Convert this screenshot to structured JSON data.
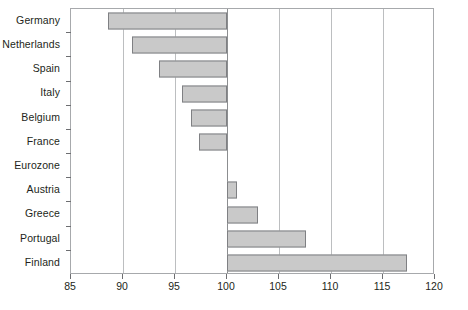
{
  "chart_data": {
    "type": "bar",
    "orientation": "horizontal",
    "title": "",
    "subtitle": "",
    "xlabel": "",
    "ylabel": "",
    "categories": [
      "Germany",
      "Netherlands",
      "Spain",
      "Italy",
      "Belgium",
      "France",
      "Eurozone",
      "Austria",
      "Greece",
      "Portugal",
      "Finland"
    ],
    "values": [
      88.6,
      90.9,
      93.5,
      95.7,
      96.5,
      97.3,
      100,
      101,
      103,
      107.6,
      117.3
    ],
    "baseline": 100,
    "xlim": [
      85,
      120
    ],
    "xticks": [
      85,
      90,
      95,
      100,
      105,
      110,
      115,
      120
    ],
    "xtick_labels": [
      "85",
      "90",
      "95",
      "100",
      "105",
      "110",
      "115",
      "120"
    ],
    "grid": true,
    "grid_axis": "x",
    "legend": null,
    "bar_fill": "#c9c9c9",
    "bar_border": "#7f8083",
    "grid_color": "#bcbec0",
    "frame_color": "#a7a9ac",
    "text_color": "#231f20",
    "background": "#ffffff"
  }
}
